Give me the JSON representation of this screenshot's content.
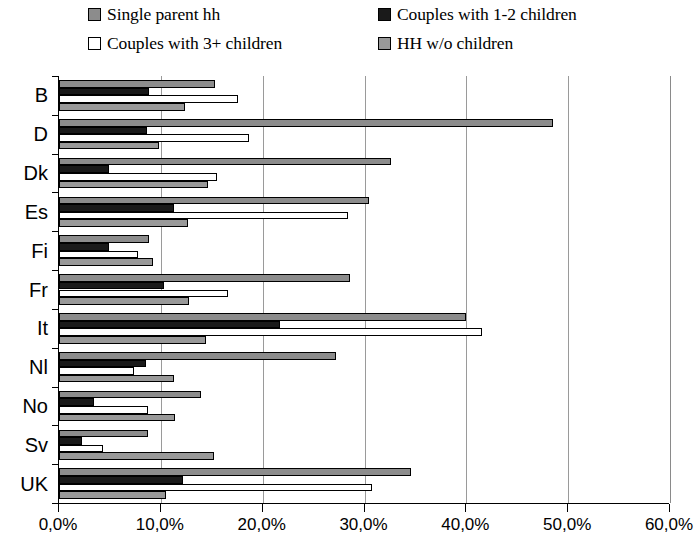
{
  "legend": {
    "items": [
      {
        "label": "Single parent hh",
        "color": "#8c8c8c"
      },
      {
        "label": "Couples with 1-2 children",
        "color": "#1a1a1a"
      },
      {
        "label": "Couples with 3+ children",
        "color": "#ffffff"
      },
      {
        "label": "HH w/o children",
        "color": "#999999"
      }
    ]
  },
  "chart_data": {
    "type": "bar",
    "orientation": "horizontal",
    "title": "",
    "xlabel": "",
    "ylabel": "",
    "xlim": [
      0,
      60
    ],
    "xticks": [
      0,
      10,
      20,
      30,
      40,
      50,
      60
    ],
    "xtick_labels": [
      "0,0%",
      "10,0%",
      "20,0%",
      "30,0%",
      "40,0%",
      "50,0%",
      "60,0%"
    ],
    "grid": true,
    "legend_position": "top",
    "categories": [
      "B",
      "D",
      "Dk",
      "Es",
      "Fi",
      "Fr",
      "It",
      "Nl",
      "No",
      "Sv",
      "UK"
    ],
    "series": [
      {
        "name": "Single parent hh",
        "color": "#8c8c8c",
        "values": [
          15.3,
          48.5,
          32.6,
          30.4,
          8.8,
          28.6,
          40.0,
          27.2,
          13.9,
          8.7,
          34.6
        ]
      },
      {
        "name": "Couples with 1-2 children",
        "color": "#1a1a1a",
        "values": [
          8.8,
          8.6,
          4.9,
          11.3,
          4.9,
          10.3,
          21.7,
          8.5,
          3.4,
          2.3,
          12.2
        ]
      },
      {
        "name": "Couples with 3+ children",
        "color": "#ffffff",
        "values": [
          17.6,
          18.7,
          15.5,
          28.4,
          7.8,
          16.6,
          41.5,
          7.4,
          8.7,
          4.3,
          30.7
        ]
      },
      {
        "name": "HH w/o children",
        "color": "#999999",
        "values": [
          12.4,
          9.8,
          14.6,
          12.7,
          9.2,
          12.8,
          14.4,
          11.3,
          11.4,
          15.2,
          10.5
        ]
      }
    ]
  }
}
